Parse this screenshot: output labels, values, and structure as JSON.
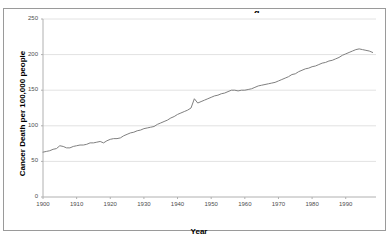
{
  "figure": {
    "title_fragment": "g",
    "border_color": "#9a9a9a",
    "background": "#ffffff"
  },
  "chart_data": {
    "type": "line",
    "title": "",
    "xlabel": "Year",
    "ylabel": "Cancer Death per 100,000 people",
    "xlim": [
      1900,
      1999
    ],
    "ylim": [
      0,
      250
    ],
    "ytick_labels": [
      "0",
      "50",
      "100",
      "150",
      "200",
      "250"
    ],
    "yticks": [
      0,
      50,
      100,
      150,
      200,
      250
    ],
    "xtick_labels": [
      "1900",
      "1910",
      "1920",
      "1930",
      "1940",
      "1950",
      "1960",
      "1970",
      "1980",
      "1990"
    ],
    "xticks": [
      1900,
      1910,
      1920,
      1930,
      1940,
      1950,
      1960,
      1970,
      1980,
      1990
    ],
    "grid": "horizontal",
    "legend": "none",
    "line_color": "#808080",
    "line_width": 1,
    "series": [
      {
        "name": "Cancer Death Rate",
        "x": [
          1900,
          1901,
          1902,
          1903,
          1904,
          1905,
          1906,
          1907,
          1908,
          1909,
          1910,
          1911,
          1912,
          1913,
          1914,
          1915,
          1916,
          1917,
          1918,
          1919,
          1920,
          1921,
          1922,
          1923,
          1924,
          1925,
          1926,
          1927,
          1928,
          1929,
          1930,
          1931,
          1932,
          1933,
          1934,
          1935,
          1936,
          1937,
          1938,
          1939,
          1940,
          1941,
          1942,
          1943,
          1944,
          1945,
          1946,
          1947,
          1948,
          1949,
          1950,
          1951,
          1952,
          1953,
          1954,
          1955,
          1956,
          1957,
          1958,
          1959,
          1960,
          1961,
          1962,
          1963,
          1964,
          1965,
          1966,
          1967,
          1968,
          1969,
          1970,
          1971,
          1972,
          1973,
          1974,
          1975,
          1976,
          1977,
          1978,
          1979,
          1980,
          1981,
          1982,
          1983,
          1984,
          1985,
          1986,
          1987,
          1988,
          1989,
          1990,
          1991,
          1992,
          1993,
          1994,
          1995,
          1996,
          1997,
          1998
        ],
        "values": [
          63,
          64,
          65,
          67,
          68,
          72,
          71,
          69,
          69,
          71,
          72,
          73,
          73,
          74,
          76,
          76,
          77,
          78,
          76,
          79,
          81,
          82,
          82,
          83,
          86,
          88,
          90,
          91,
          93,
          94,
          96,
          97,
          98,
          99,
          102,
          104,
          106,
          108,
          111,
          113,
          116,
          118,
          120,
          122,
          125,
          138,
          132,
          134,
          136,
          138,
          140,
          142,
          143,
          145,
          146,
          148,
          150,
          150,
          149,
          150,
          150,
          151,
          152,
          154,
          156,
          157,
          158,
          159,
          160,
          161,
          163,
          165,
          167,
          169,
          172,
          173,
          176,
          178,
          180,
          181,
          183,
          184,
          186,
          188,
          189,
          191,
          192,
          194,
          196,
          199,
          201,
          203,
          205,
          207,
          208,
          207,
          206,
          205,
          203
        ]
      }
    ]
  }
}
